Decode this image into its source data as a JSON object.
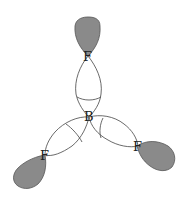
{
  "diagram": {
    "atoms": {
      "center": "B",
      "top": "F",
      "left": "F",
      "right": "F"
    },
    "colors": {
      "shaded_lobe": "#8a8a8a",
      "outline": "#444444",
      "background": "#ffffff"
    }
  }
}
